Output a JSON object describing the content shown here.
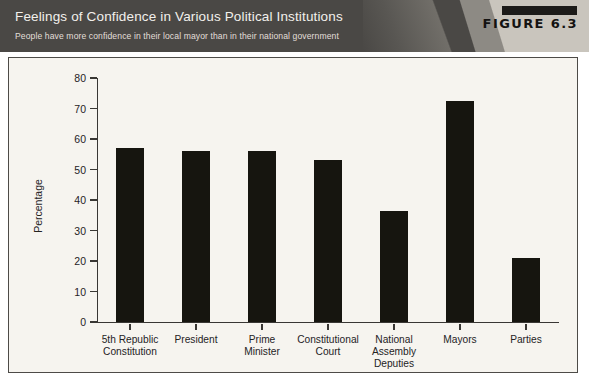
{
  "header": {
    "title": "Feelings of Confidence in Various Political Institutions",
    "subtitle": "People have more confidence in their local mayor than in their national government",
    "figure_label": "FIGURE 6.3",
    "banner_color": "#4a4845",
    "wedge_color": "#c9c5bd",
    "title_color": "#f2f0ec"
  },
  "chart_data": {
    "type": "bar",
    "title": "Feelings of Confidence in Various Political Institutions",
    "subtitle": "People have more confidence in their local mayor than in their national government",
    "categories": [
      "5th Republic Constitution",
      "President",
      "Prime Minister",
      "Constitutional Court",
      "National Assembly Deputies",
      "Mayors",
      "Parties"
    ],
    "category_lines": [
      [
        "5th Republic",
        "Constitution"
      ],
      [
        "President"
      ],
      [
        "Prime",
        "Minister"
      ],
      [
        "Constitutional",
        "Court"
      ],
      [
        "National",
        "Assembly",
        "Deputies"
      ],
      [
        "Mayors"
      ],
      [
        "Parties"
      ]
    ],
    "values": [
      57,
      56,
      56,
      53,
      36.5,
      72.5,
      21
    ],
    "xlabel": "",
    "ylabel": "Percentage",
    "ylim": [
      0,
      80
    ],
    "yticks": [
      0,
      10,
      20,
      30,
      40,
      50,
      60,
      70,
      80
    ],
    "ytick_labels": [
      "0",
      "10",
      "20",
      "30",
      "40",
      "50",
      "60",
      "70",
      "80"
    ],
    "grid": false,
    "legend": false,
    "bar_color": "#16150f",
    "plot_background": "#f6f4ef",
    "axis_color": "#393734"
  }
}
